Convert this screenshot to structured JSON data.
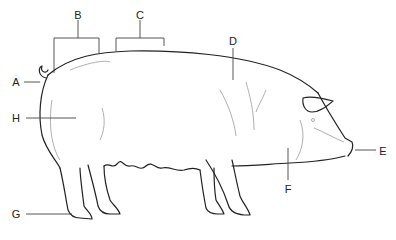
{
  "diagram": {
    "colors": {
      "outline": "#222222",
      "detail": "#9a9a9a",
      "leader": "#444444",
      "background": "#ffffff"
    },
    "labels": [
      {
        "id": "A",
        "text": "A",
        "x": 16,
        "y": 82
      },
      {
        "id": "B",
        "text": "B",
        "x": 78,
        "y": 15
      },
      {
        "id": "C",
        "text": "C",
        "x": 140,
        "y": 15
      },
      {
        "id": "D",
        "text": "D",
        "x": 233,
        "y": 41
      },
      {
        "id": "E",
        "text": "E",
        "x": 383,
        "y": 151
      },
      {
        "id": "F",
        "text": "F",
        "x": 288,
        "y": 189
      },
      {
        "id": "G",
        "text": "G",
        "x": 16,
        "y": 214
      },
      {
        "id": "H",
        "text": "H",
        "x": 16,
        "y": 118
      }
    ]
  }
}
